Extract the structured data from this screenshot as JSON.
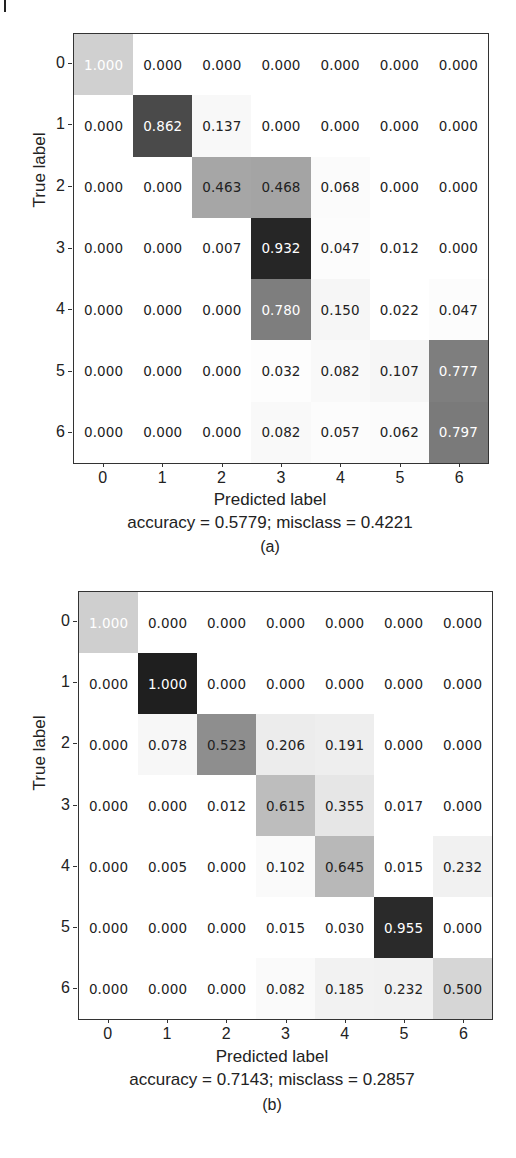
{
  "chart_data": [
    {
      "type": "heatmap",
      "title": "",
      "panel_label": "(a)",
      "xlabel": "Predicted label",
      "ylabel": "True label",
      "x_ticks": [
        "0",
        "1",
        "2",
        "3",
        "4",
        "5",
        "6"
      ],
      "y_ticks": [
        "0",
        "1",
        "2",
        "3",
        "4",
        "5",
        "6"
      ],
      "colormap": "grayscale (darker = higher count)",
      "matrix": [
        [
          1.0,
          0.0,
          0.0,
          0.0,
          0.0,
          0.0,
          0.0
        ],
        [
          0.0,
          0.862,
          0.137,
          0.0,
          0.0,
          0.0,
          0.0
        ],
        [
          0.0,
          0.0,
          0.463,
          0.468,
          0.068,
          0.0,
          0.0
        ],
        [
          0.0,
          0.0,
          0.007,
          0.932,
          0.047,
          0.012,
          0.0
        ],
        [
          0.0,
          0.0,
          0.0,
          0.78,
          0.15,
          0.022,
          0.047
        ],
        [
          0.0,
          0.0,
          0.0,
          0.032,
          0.082,
          0.107,
          0.777
        ],
        [
          0.0,
          0.0,
          0.0,
          0.082,
          0.057,
          0.062,
          0.797
        ]
      ],
      "metrics_text": "accuracy = 0.5779; misclass = 0.4221",
      "accuracy": 0.5779,
      "misclass": 0.4221
    },
    {
      "type": "heatmap",
      "title": "",
      "panel_label": "(b)",
      "xlabel": "Predicted label",
      "ylabel": "True label",
      "x_ticks": [
        "0",
        "1",
        "2",
        "3",
        "4",
        "5",
        "6"
      ],
      "y_ticks": [
        "0",
        "1",
        "2",
        "3",
        "4",
        "5",
        "6"
      ],
      "colormap": "grayscale (darker = higher count)",
      "matrix": [
        [
          1.0,
          0.0,
          0.0,
          0.0,
          0.0,
          0.0,
          0.0
        ],
        [
          0.0,
          1.0,
          0.0,
          0.0,
          0.0,
          0.0,
          0.0
        ],
        [
          0.0,
          0.078,
          0.523,
          0.206,
          0.191,
          0.0,
          0.0
        ],
        [
          0.0,
          0.0,
          0.012,
          0.615,
          0.355,
          0.017,
          0.0
        ],
        [
          0.0,
          0.005,
          0.0,
          0.102,
          0.645,
          0.015,
          0.232
        ],
        [
          0.0,
          0.0,
          0.0,
          0.015,
          0.03,
          0.955,
          0.0
        ],
        [
          0.0,
          0.0,
          0.0,
          0.082,
          0.185,
          0.232,
          0.5
        ]
      ],
      "metrics_text": "accuracy = 0.7143; misclass = 0.2857",
      "accuracy": 0.7143,
      "misclass": 0.2857
    }
  ],
  "panels": [
    {
      "cell_colors": [
        [
          "#d0d0d0",
          "#ffffff",
          "#ffffff",
          "#ffffff",
          "#ffffff",
          "#ffffff",
          "#ffffff"
        ],
        [
          "#ffffff",
          "#4a4a4a",
          "#f8f8f8",
          "#ffffff",
          "#ffffff",
          "#ffffff",
          "#ffffff"
        ],
        [
          "#ffffff",
          "#ffffff",
          "#a6a6a6",
          "#a4a4a4",
          "#fbfbfb",
          "#ffffff",
          "#ffffff"
        ],
        [
          "#ffffff",
          "#ffffff",
          "#ffffff",
          "#262626",
          "#fcfcfc",
          "#ffffff",
          "#ffffff"
        ],
        [
          "#ffffff",
          "#ffffff",
          "#ffffff",
          "#7e7e7e",
          "#f6f6f6",
          "#ffffff",
          "#fcfcfc"
        ],
        [
          "#ffffff",
          "#ffffff",
          "#ffffff",
          "#fdfdfd",
          "#f9f9f9",
          "#f6f6f6",
          "#7e7e7e"
        ],
        [
          "#ffffff",
          "#ffffff",
          "#ffffff",
          "#f9f9f9",
          "#fcfcfc",
          "#fbfbfb",
          "#7a7a7a"
        ]
      ],
      "text_colors": [
        [
          "#ffffff",
          "#222222",
          "#222222",
          "#222222",
          "#222222",
          "#222222",
          "#222222"
        ],
        [
          "#222222",
          "#ffffff",
          "#222222",
          "#222222",
          "#222222",
          "#222222",
          "#222222"
        ],
        [
          "#222222",
          "#222222",
          "#222222",
          "#222222",
          "#222222",
          "#222222",
          "#222222"
        ],
        [
          "#222222",
          "#222222",
          "#222222",
          "#ffffff",
          "#222222",
          "#222222",
          "#222222"
        ],
        [
          "#222222",
          "#222222",
          "#222222",
          "#ffffff",
          "#222222",
          "#222222",
          "#222222"
        ],
        [
          "#222222",
          "#222222",
          "#222222",
          "#222222",
          "#222222",
          "#222222",
          "#ffffff"
        ],
        [
          "#222222",
          "#222222",
          "#222222",
          "#222222",
          "#222222",
          "#222222",
          "#ffffff"
        ]
      ]
    },
    {
      "cell_colors": [
        [
          "#cfcfcf",
          "#ffffff",
          "#ffffff",
          "#ffffff",
          "#ffffff",
          "#ffffff",
          "#ffffff"
        ],
        [
          "#ffffff",
          "#1f1f1f",
          "#ffffff",
          "#ffffff",
          "#ffffff",
          "#ffffff",
          "#ffffff"
        ],
        [
          "#ffffff",
          "#f7f7f7",
          "#8e8e8e",
          "#ececec",
          "#eeeeee",
          "#ffffff",
          "#ffffff"
        ],
        [
          "#ffffff",
          "#ffffff",
          "#ffffff",
          "#bdbdbd",
          "#e6e6e6",
          "#ffffff",
          "#ffffff"
        ],
        [
          "#ffffff",
          "#ffffff",
          "#ffffff",
          "#fafafa",
          "#b8b8b8",
          "#ffffff",
          "#f1f1f1"
        ],
        [
          "#ffffff",
          "#ffffff",
          "#ffffff",
          "#ffffff",
          "#ffffff",
          "#2a2a2a",
          "#ffffff"
        ],
        [
          "#ffffff",
          "#ffffff",
          "#ffffff",
          "#fafafa",
          "#f2f2f2",
          "#f1f1f1",
          "#d6d6d6"
        ]
      ],
      "text_colors": [
        [
          "#ffffff",
          "#222222",
          "#222222",
          "#222222",
          "#222222",
          "#222222",
          "#222222"
        ],
        [
          "#222222",
          "#ffffff",
          "#222222",
          "#222222",
          "#222222",
          "#222222",
          "#222222"
        ],
        [
          "#222222",
          "#222222",
          "#222222",
          "#222222",
          "#222222",
          "#222222",
          "#222222"
        ],
        [
          "#222222",
          "#222222",
          "#222222",
          "#222222",
          "#222222",
          "#222222",
          "#222222"
        ],
        [
          "#222222",
          "#222222",
          "#222222",
          "#222222",
          "#222222",
          "#222222",
          "#222222"
        ],
        [
          "#222222",
          "#222222",
          "#222222",
          "#222222",
          "#222222",
          "#ffffff",
          "#222222"
        ],
        [
          "#222222",
          "#222222",
          "#222222",
          "#222222",
          "#222222",
          "#222222",
          "#222222"
        ]
      ]
    }
  ]
}
